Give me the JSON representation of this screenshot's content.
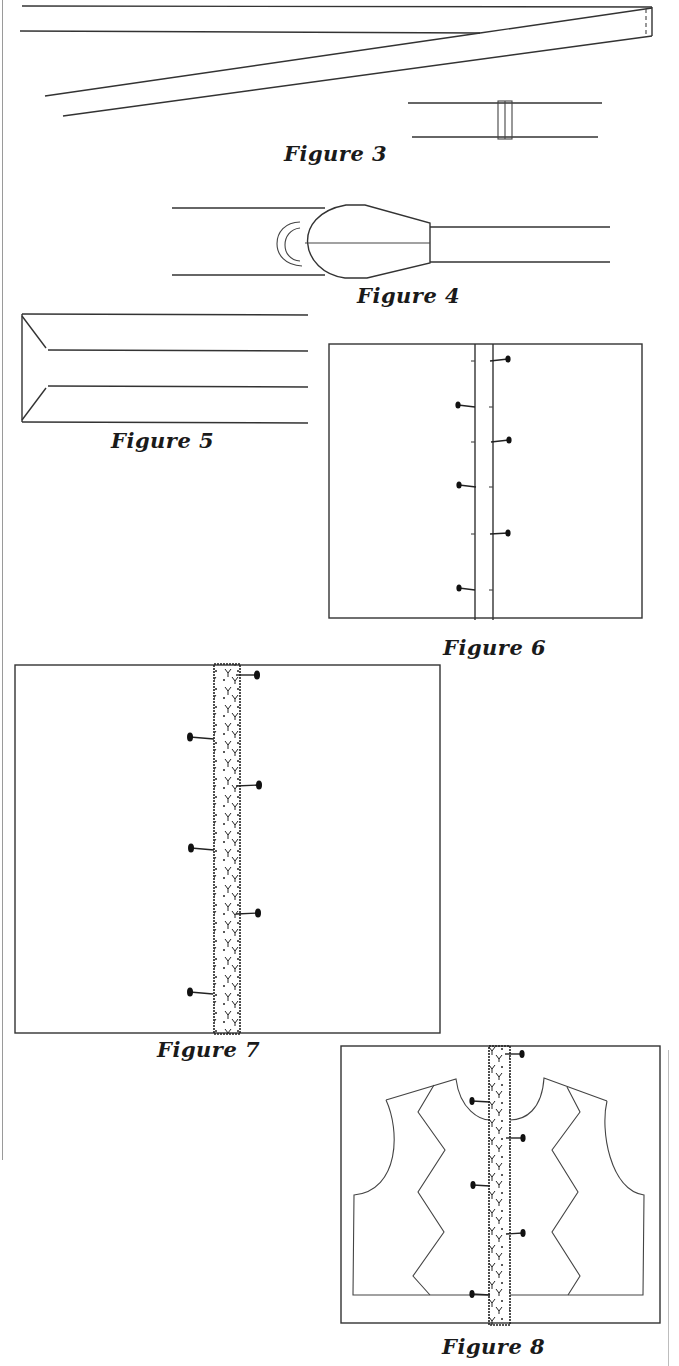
{
  "page": {
    "background": "#ffffff",
    "line_color": "#333333"
  },
  "figures": [
    {
      "id": "figure-3",
      "caption": "Figure 3",
      "description": "Strip of binding folded diagonally; joined strips with seam"
    },
    {
      "id": "figure-4",
      "caption": "Figure 4",
      "description": "Bias tape maker pulling fabric strip through"
    },
    {
      "id": "figure-5",
      "caption": "Figure 5",
      "description": "Folded strip with mitered end"
    },
    {
      "id": "figure-6",
      "caption": "Figure 6",
      "description": "Strip pinned onto fabric panel with alternating pins"
    },
    {
      "id": "figure-7",
      "caption": "Figure 7",
      "description": "Lace trim strip pinned onto fabric panel"
    },
    {
      "id": "figure-8",
      "caption": "Figure 8",
      "description": "Vest front pattern pieces laid over lace-trimmed panel"
    }
  ]
}
